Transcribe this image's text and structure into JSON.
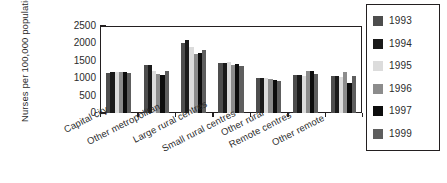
{
  "chart_data": {
    "type": "bar",
    "title": "",
    "xlabel": "",
    "ylabel_lines": [
      "Nurses per",
      "100,000 population"
    ],
    "ylabel": "Nurses per 100,000 population",
    "ylim": [
      0,
      2500
    ],
    "yticks": [
      2500,
      2000,
      1500,
      1000,
      500,
      0
    ],
    "grid": false,
    "legend_position": "right",
    "categories": [
      "Capital city",
      "Other metropolitan",
      "Large rural centres",
      "Small rural centres",
      "Other rural",
      "Remote centres",
      "Other remote"
    ],
    "series": [
      {
        "name": "1993",
        "color": "#4d4d4d",
        "values": [
          1150,
          1370,
          2020,
          1430,
          1010,
          1080,
          1050
        ]
      },
      {
        "name": "1994",
        "color": "#1a1a1a",
        "values": [
          1180,
          1370,
          2090,
          1440,
          1010,
          1080,
          1060
        ]
      },
      {
        "name": "1995",
        "color": "#dcdcdc",
        "values": [
          1180,
          1200,
          1900,
          1460,
          1000,
          1060,
          1040
        ]
      },
      {
        "name": "1996",
        "color": "#8c8c8c",
        "values": [
          1180,
          1130,
          1700,
          1390,
          980,
          1210,
          1190
        ]
      },
      {
        "name": "1997",
        "color": "#0d0d0d",
        "values": [
          1180,
          1080,
          1720,
          1400,
          960,
          1210,
          870
        ]
      },
      {
        "name": "1999",
        "color": "#5e5e5e",
        "values": [
          1150,
          1210,
          1800,
          1340,
          920,
          1120,
          1070
        ]
      }
    ]
  },
  "legend": {
    "items": [
      {
        "label": "1993"
      },
      {
        "label": "1994"
      },
      {
        "label": "1995"
      },
      {
        "label": "1996"
      },
      {
        "label": "1997"
      },
      {
        "label": "1999"
      }
    ]
  },
  "colors": {
    "axis": "#231f20",
    "background": "#ffffff",
    "text": "#2b2b2b"
  }
}
